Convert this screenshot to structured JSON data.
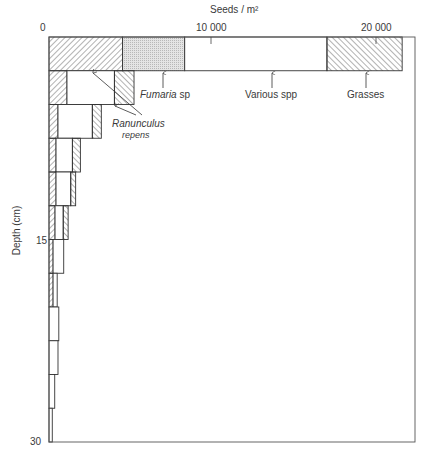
{
  "chart_data": {
    "type": "bar",
    "orientation": "horizontal-stacked",
    "title": "Seeds / m²",
    "xlabel": "Seeds / m²",
    "ylabel": "Depth (cm)",
    "xlim": [
      0,
      22500
    ],
    "ylim": [
      0,
      30
    ],
    "x_ticks": [
      {
        "value": 0,
        "label": "0"
      },
      {
        "value": 10000,
        "label": "10 000"
      },
      {
        "value": 20000,
        "label": "20 000"
      }
    ],
    "y_ticks": [
      {
        "value": 15,
        "label": "15"
      },
      {
        "value": 30,
        "label": "30"
      }
    ],
    "grid": false,
    "depth_bands_cm": [
      [
        0,
        2.5
      ],
      [
        2.5,
        5
      ],
      [
        5,
        7.5
      ],
      [
        7.5,
        10
      ],
      [
        10,
        12.5
      ],
      [
        12.5,
        15
      ],
      [
        15,
        17.5
      ],
      [
        17.5,
        20
      ],
      [
        20,
        22.5
      ],
      [
        22.5,
        25
      ],
      [
        25,
        27.5
      ],
      [
        27.5,
        30
      ]
    ],
    "series": [
      {
        "name": "Ranunculus repens",
        "pattern": "hatch-forward",
        "values": [
          4500,
          1100,
          550,
          430,
          430,
          370,
          250,
          250,
          0,
          0,
          0,
          0
        ]
      },
      {
        "name": "Fumaria sp",
        "pattern": "stipple",
        "values": [
          3800,
          0,
          0,
          0,
          0,
          0,
          0,
          0,
          0,
          0,
          0,
          0
        ]
      },
      {
        "name": "Various spp",
        "pattern": "none",
        "values": [
          8700,
          2900,
          2100,
          1000,
          900,
          500,
          650,
          250,
          600,
          550,
          350,
          200
        ]
      },
      {
        "name": "Grasses",
        "pattern": "hatch-back",
        "values": [
          4600,
          1200,
          550,
          490,
          300,
          300,
          0,
          0,
          0,
          0,
          0,
          0
        ]
      }
    ],
    "annotations": [
      {
        "text": "Ranunculus",
        "text2": "repens",
        "italic": true
      },
      {
        "text": "Fumaria",
        "suffix": " sp",
        "italic": true
      },
      {
        "text": "Various spp"
      },
      {
        "text": "Grasses"
      }
    ]
  },
  "labels": {
    "x_axis_title": "Seeds / m²",
    "y_axis_title": "Depth (cm)",
    "x0": "0",
    "x10k": "10 000",
    "x20k": "20 000",
    "y15": "15",
    "y30": "30",
    "ranunculus_1": "Ranunculus",
    "ranunculus_2": "repens",
    "fumaria": "Fumaria",
    "fumaria_suffix": " sp",
    "various": "Various spp",
    "grasses": "Grasses"
  },
  "colors": {
    "line": "#333333",
    "hatch": "#555555",
    "stipple": "#cfcfcf",
    "background": "#ffffff"
  }
}
